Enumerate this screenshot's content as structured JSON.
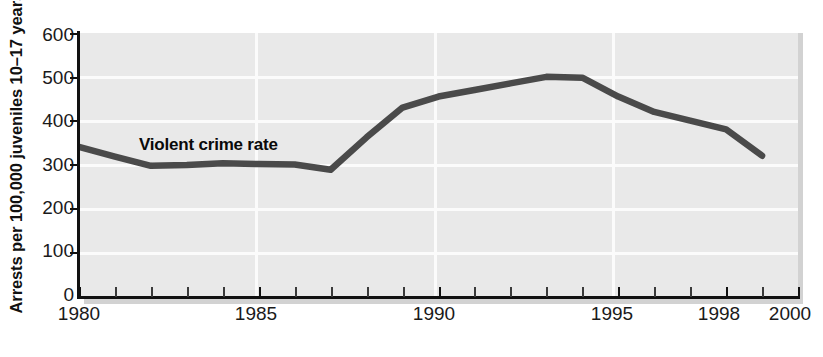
{
  "chart_data": {
    "type": "line",
    "title": "",
    "xlabel": "",
    "ylabel": "Arrests per 100,000 juveniles 10–17 years",
    "xlim": [
      1980,
      2000
    ],
    "ylim": [
      0,
      600
    ],
    "grid": true,
    "legend_position": "inline-annotation",
    "annotations": [
      {
        "text": "Violent crime rate",
        "x": 1981.8,
        "y": 375
      }
    ],
    "ytick_labels": [
      "600",
      "500",
      "400",
      "300",
      "200",
      "100",
      "0"
    ],
    "ytick_values": [
      600,
      500,
      400,
      300,
      200,
      100,
      0
    ],
    "xtick_labels": [
      "1980",
      "1985",
      "1990",
      "1995",
      "1998",
      "2000"
    ],
    "xtick_values": [
      1980,
      1985,
      1990,
      1995,
      1998,
      2000
    ],
    "xminor_ticks": [
      1981,
      1982,
      1983,
      1984,
      1986,
      1987,
      1988,
      1989,
      1991,
      1992,
      1993,
      1994,
      1996,
      1997,
      1999
    ],
    "series": [
      {
        "name": "Violent crime rate",
        "color": "#4a4a4a",
        "x": [
          1980,
          1981,
          1982,
          1983,
          1984,
          1985,
          1986,
          1987,
          1988,
          1989,
          1990,
          1991,
          1992,
          1993,
          1994,
          1995,
          1996,
          1997,
          1998,
          1999
        ],
        "values": [
          340,
          318,
          297,
          299,
          303,
          301,
          300,
          288,
          362,
          430,
          455,
          470,
          485,
          500,
          498,
          455,
          420,
          400,
          380,
          320
        ]
      }
    ],
    "colors": {
      "plot_background": "#e9e9e9",
      "gridline": "#fbfbfb",
      "line": "#4a4a4a",
      "axis": "#111111",
      "text": "#1a1a1a",
      "shadow": "#d2d2d2",
      "page_background": "#ffffff"
    }
  }
}
